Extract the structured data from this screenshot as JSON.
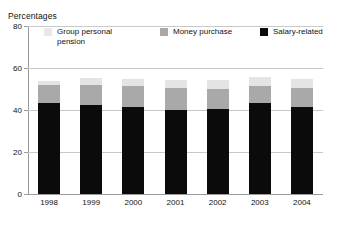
{
  "chart_data": {
    "type": "bar",
    "subtype": "stacked-vertical",
    "title": "Percentages",
    "xlabel": "",
    "ylabel": "Percentages",
    "ylim": [
      0,
      80
    ],
    "yticks": [
      0,
      20,
      40,
      60,
      80
    ],
    "grid": true,
    "legend_position": "top-inside",
    "categories": [
      "1998",
      "1999",
      "2000",
      "2001",
      "2002",
      "2003",
      "2004"
    ],
    "series": [
      {
        "name": "Salary-related",
        "color": "#0b0b0b",
        "values": [
          43.2,
          42.5,
          41.4,
          40.2,
          40.3,
          43.1,
          41.6
        ]
      },
      {
        "name": "Money purchase",
        "color": "#a9a9a9",
        "values": [
          8.6,
          9.6,
          9.9,
          10.4,
          9.9,
          8.3,
          9.1
        ]
      },
      {
        "name": "Group personal pension",
        "color": "#e4e4e4",
        "values": [
          1.9,
          3.3,
          3.7,
          3.6,
          4.2,
          4.5,
          4.0
        ]
      }
    ],
    "totals": [
      53.7,
      55.4,
      55.0,
      54.2,
      54.4,
      55.9,
      54.7
    ]
  },
  "chart": {
    "axis_title": "Percentages",
    "y_ticks": [
      {
        "label": "80",
        "value": 80
      },
      {
        "label": "60",
        "value": 60
      },
      {
        "label": "40",
        "value": 40
      },
      {
        "label": "20",
        "value": 20
      },
      {
        "label": "0",
        "value": 0
      }
    ],
    "x_ticks": [
      "1998",
      "1999",
      "2000",
      "2001",
      "2002",
      "2003",
      "2004"
    ],
    "legend": [
      {
        "label_line1": "Group personal",
        "label_line2": "pension",
        "swatch": "#e9e9e9"
      },
      {
        "label_line1": "Money purchase",
        "label_line2": "",
        "swatch": "#a9a9a9"
      },
      {
        "label_line1": "Salary-related",
        "label_line2": "",
        "swatch": "#0b0b0b"
      }
    ]
  }
}
